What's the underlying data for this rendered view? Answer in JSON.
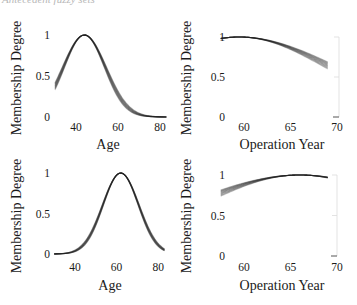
{
  "caption_fragment": "Antecedent fuzzy sets",
  "chart_data": [
    {
      "type": "line",
      "panel": "top-left",
      "title": "",
      "xlabel": "Age",
      "ylabel": "Membership Degree",
      "xticks": [
        "40",
        "60",
        "80"
      ],
      "yticks": [
        "0",
        "0.5",
        "1"
      ],
      "xlim": [
        30,
        83
      ],
      "ylim": [
        0,
        1
      ],
      "grid": false,
      "shape": {
        "kind": "gaussian",
        "center": 44,
        "sigma": 10,
        "band_sigma_spread": 0.6
      },
      "x": [
        30,
        34,
        38,
        42,
        44,
        46,
        50,
        54,
        58,
        62,
        66,
        70,
        74,
        78,
        83
      ],
      "values": [
        0.38,
        0.61,
        0.84,
        0.98,
        1.0,
        0.98,
        0.84,
        0.61,
        0.38,
        0.2,
        0.09,
        0.03,
        0.01,
        0.003,
        0.0
      ]
    },
    {
      "type": "line",
      "panel": "top-right",
      "title": "",
      "xlabel": "Operation Year",
      "ylabel": "Membership Degree",
      "xticks": [
        "60",
        "65",
        "70"
      ],
      "yticks": [
        "0",
        "0.5",
        "1"
      ],
      "xlim": [
        57.5,
        69
      ],
      "ylim": [
        0,
        1
      ],
      "grid": false,
      "shape": {
        "kind": "gaussian",
        "center": 59.5,
        "sigma": 10.2,
        "band_sigma_spread": 0.8
      },
      "x": [
        57.5,
        59.5,
        61,
        63,
        65,
        67,
        69
      ],
      "values": [
        0.98,
        1.0,
        0.99,
        0.94,
        0.86,
        0.76,
        0.65
      ]
    },
    {
      "type": "line",
      "panel": "bottom-left",
      "title": "",
      "xlabel": "Age",
      "ylabel": "Membership Degree",
      "xticks": [
        "40",
        "60",
        "80"
      ],
      "yticks": [
        "0",
        "0.5",
        "1"
      ],
      "xlim": [
        30,
        83
      ],
      "ylim": [
        0,
        1
      ],
      "grid": false,
      "shape": {
        "kind": "gaussian",
        "center": 62,
        "sigma": 8.6,
        "band_sigma_spread": 0.35
      },
      "x": [
        30,
        40,
        46,
        50,
        54,
        58,
        62,
        66,
        70,
        74,
        78,
        83
      ],
      "values": [
        0.0,
        0.04,
        0.18,
        0.38,
        0.65,
        0.9,
        1.0,
        0.9,
        0.65,
        0.38,
        0.18,
        0.05
      ]
    },
    {
      "type": "line",
      "panel": "bottom-right",
      "title": "",
      "xlabel": "Operation Year",
      "ylabel": "Membership Degree",
      "xticks": [
        "60",
        "65",
        "70"
      ],
      "yticks": [
        "0",
        "0.5",
        "1"
      ],
      "xlim": [
        57.5,
        69
      ],
      "ylim": [
        0,
        1
      ],
      "grid": false,
      "shape": {
        "kind": "gaussian",
        "center": 66,
        "sigma": 12.1,
        "band_sigma_spread": 1.2
      },
      "x": [
        57.5,
        59,
        61,
        63,
        65,
        66,
        67,
        69
      ],
      "values": [
        0.78,
        0.85,
        0.92,
        0.97,
        1.0,
        1.0,
        1.0,
        0.97
      ]
    }
  ]
}
